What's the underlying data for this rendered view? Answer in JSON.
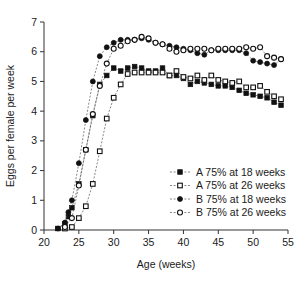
{
  "chart_data": {
    "type": "scatter",
    "title": "",
    "xlabel": "Age (weeks)",
    "ylabel": "Eggs per female per week",
    "xlim": [
      20,
      55
    ],
    "ylim": [
      0,
      7
    ],
    "xticks": [
      20,
      25,
      30,
      35,
      40,
      45,
      50,
      55
    ],
    "yticks": [
      0,
      1,
      2,
      3,
      4,
      5,
      6,
      7
    ],
    "grid": false,
    "legend_position": "center-right",
    "series": [
      {
        "name": "A 75% at 18 weeks",
        "marker": "filled-square",
        "x": [
          22,
          23,
          23.5,
          24,
          25,
          26,
          27,
          28,
          29,
          30,
          31,
          32,
          33,
          34,
          35,
          36,
          37,
          38,
          39,
          40,
          41,
          42,
          43,
          44,
          45,
          46,
          47,
          48,
          49,
          50,
          51,
          52,
          53,
          54
        ],
        "y": [
          0.05,
          0.2,
          0.45,
          0.75,
          1.55,
          2.7,
          3.85,
          4.9,
          5.2,
          5.45,
          5.35,
          5.45,
          5.5,
          5.45,
          5.35,
          5.35,
          5.45,
          5.2,
          5.2,
          5.1,
          4.9,
          5.0,
          4.95,
          4.9,
          4.85,
          4.85,
          4.8,
          4.7,
          4.6,
          4.55,
          4.5,
          4.45,
          4.3,
          4.2
        ]
      },
      {
        "name": "A 75% at 26 weeks",
        "marker": "open-square",
        "x": [
          23,
          24,
          25,
          26,
          27,
          28,
          29,
          30,
          31,
          32,
          33,
          34,
          35,
          36,
          37,
          38,
          39,
          40,
          41,
          42,
          43,
          44,
          45,
          46,
          47,
          48,
          49,
          50,
          51,
          52,
          53,
          54
        ],
        "y": [
          0.05,
          0.1,
          0.4,
          0.8,
          1.55,
          2.65,
          3.75,
          4.45,
          4.9,
          5.25,
          5.3,
          5.3,
          5.3,
          5.3,
          5.3,
          5.2,
          5.35,
          5.15,
          5.1,
          5.2,
          5.05,
          5.2,
          5.05,
          5.0,
          4.95,
          5.0,
          4.8,
          4.8,
          4.85,
          4.65,
          4.5,
          4.4
        ]
      },
      {
        "name": "B 75% at 18 weeks",
        "marker": "filled-circle",
        "x": [
          22,
          23,
          23.5,
          24,
          25,
          26,
          27,
          28,
          29,
          30,
          31,
          32,
          33,
          34,
          35,
          36,
          37,
          38,
          39,
          40,
          41,
          42,
          43,
          44,
          45,
          46,
          47,
          48,
          49,
          50,
          51,
          52,
          53,
          54
        ],
        "y": [
          0.05,
          0.25,
          0.6,
          1.0,
          2.25,
          3.7,
          5.0,
          5.85,
          6.15,
          6.3,
          6.4,
          6.4,
          6.4,
          6.45,
          6.4,
          6.3,
          6.25,
          6.2,
          6.15,
          6.1,
          6.05,
          5.95,
          5.9,
          6.05,
          6.05,
          6.05,
          6.05,
          6.05,
          5.95,
          5.7,
          5.65,
          5.6,
          5.55,
          5.75
        ]
      },
      {
        "name": "B 75% at 26 weeks",
        "marker": "open-circle",
        "x": [
          23,
          24,
          25,
          26,
          27,
          28,
          29,
          30,
          31,
          32,
          33,
          34,
          35,
          36,
          37,
          38,
          39,
          40,
          41,
          42,
          43,
          44,
          45,
          46,
          47,
          48,
          49,
          50,
          51,
          52,
          53,
          54
        ],
        "y": [
          0.1,
          0.4,
          1.5,
          2.7,
          3.9,
          4.85,
          5.6,
          6.1,
          6.2,
          6.35,
          6.4,
          6.5,
          6.45,
          6.3,
          6.25,
          6.1,
          6.0,
          6.05,
          6.1,
          6.1,
          6.1,
          6.05,
          6.1,
          6.1,
          6.1,
          6.1,
          6.15,
          6.1,
          6.15,
          5.85,
          5.8,
          5.75
        ]
      }
    ]
  },
  "legend": {
    "items": [
      {
        "label": "A 75% at 18 weeks",
        "marker": "filled-square"
      },
      {
        "label": "A 75% at 26 weeks",
        "marker": "open-square"
      },
      {
        "label": "B 75% at 18 weeks",
        "marker": "filled-circle"
      },
      {
        "label": "B 75% at 26 weeks",
        "marker": "open-circle"
      }
    ]
  },
  "colors": {
    "axis": "#333333",
    "line": "#555555",
    "marker": "#111111",
    "background": "#ffffff"
  }
}
